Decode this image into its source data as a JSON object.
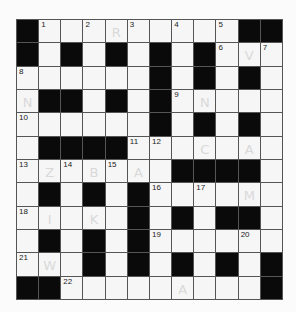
{
  "puzzle": {
    "rows": 12,
    "cols": 12,
    "colors": {
      "block": "#0a0a0a",
      "cell": "#f6f6f6",
      "gridline": "#555555",
      "pencil": "#d9d9d9",
      "number": "#222222"
    },
    "grid": [
      [
        "#",
        "1",
        "",
        "2",
        "",
        "3",
        "",
        "4",
        "",
        "5",
        "#",
        "#"
      ],
      [
        "#",
        "",
        "#",
        "",
        "#",
        "",
        "#",
        "",
        "#",
        "6",
        "",
        "7"
      ],
      [
        "8",
        "",
        "",
        "",
        "",
        "",
        "#",
        "",
        "#",
        "",
        "#",
        ""
      ],
      [
        "",
        "#",
        "#",
        "",
        "#",
        "",
        "#",
        "9",
        "",
        "",
        "",
        ""
      ],
      [
        "10",
        "",
        "",
        "",
        "",
        "",
        "#",
        "",
        "#",
        "",
        "#",
        ""
      ],
      [
        "",
        "#",
        "#",
        "#",
        "#",
        "11",
        "12",
        "",
        "",
        "",
        "",
        ""
      ],
      [
        "13",
        "",
        "14",
        "",
        "15",
        "",
        "",
        "#",
        "#",
        "#",
        "#",
        ""
      ],
      [
        "",
        "#",
        "",
        "#",
        "",
        "#",
        "16",
        "",
        "17",
        "",
        "",
        ""
      ],
      [
        "18",
        "",
        "",
        "",
        "",
        "#",
        "",
        "#",
        "",
        "#",
        "#",
        ""
      ],
      [
        "",
        "#",
        "",
        "#",
        "",
        "#",
        "19",
        "",
        "",
        "",
        "20",
        ""
      ],
      [
        "21",
        "",
        "",
        "#",
        "",
        "#",
        "",
        "#",
        "",
        "#",
        "",
        "#"
      ],
      [
        "#",
        "#",
        "22",
        "",
        "",
        "",
        "",
        "",
        "",
        "",
        "",
        "#"
      ]
    ],
    "pencil_marks": [
      {
        "row": 0,
        "col": 4,
        "letter": "R"
      },
      {
        "row": 1,
        "col": 10,
        "letter": "V"
      },
      {
        "row": 3,
        "col": 0,
        "letter": "N"
      },
      {
        "row": 3,
        "col": 8,
        "letter": "N"
      },
      {
        "row": 5,
        "col": 8,
        "letter": "C"
      },
      {
        "row": 5,
        "col": 10,
        "letter": "A"
      },
      {
        "row": 6,
        "col": 1,
        "letter": "Z"
      },
      {
        "row": 6,
        "col": 3,
        "letter": "B"
      },
      {
        "row": 6,
        "col": 5,
        "letter": "A"
      },
      {
        "row": 7,
        "col": 10,
        "letter": "M"
      },
      {
        "row": 8,
        "col": 1,
        "letter": "I"
      },
      {
        "row": 8,
        "col": 3,
        "letter": "K"
      },
      {
        "row": 10,
        "col": 1,
        "letter": "W"
      },
      {
        "row": 11,
        "col": 7,
        "letter": "A"
      }
    ]
  }
}
